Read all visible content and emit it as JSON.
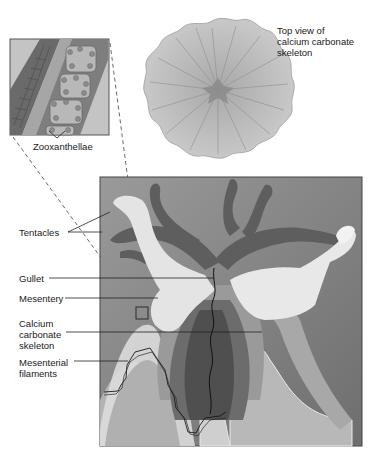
{
  "labels": {
    "top_view": "Top view of\ncalcium carbonate\nskeleton",
    "zooxanthellae": "Zooxanthellae",
    "tentacles": "Tentacles",
    "gullet": "Gullet",
    "mesentery": "Mesentery",
    "skeleton": "Calcium\ncarbonate\nskeleton",
    "filaments": "Mesenterial\nfilaments"
  },
  "colors": {
    "background": "#ffffff",
    "panel_bg": "#8c8c8c",
    "tentacle": "#5e5e5e",
    "body_light": "#e2e2e2",
    "skeleton": "#bdbdbd",
    "gullet_dark": "#4f4f4f"
  }
}
